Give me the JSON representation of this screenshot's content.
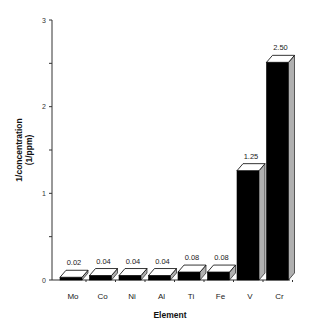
{
  "chart_data": {
    "type": "bar",
    "title": "",
    "xlabel": "Element",
    "ylabel": "1/concentration (1/ppm)",
    "ylabel_lines": [
      "1/concentration",
      "(1/ppm)"
    ],
    "categories": [
      "Mo",
      "Co",
      "Ni",
      "Al",
      "Ti",
      "Fe",
      "V",
      "Cr"
    ],
    "values": [
      0.02,
      0.04,
      0.04,
      0.04,
      0.08,
      0.08,
      1.25,
      2.5
    ],
    "value_labels": [
      "0.02",
      "0.04",
      "0.04",
      "0.04",
      "0.08",
      "0.08",
      "1.25",
      "2.50"
    ],
    "ylim": [
      0,
      3
    ],
    "yticks": [
      0,
      1,
      2,
      3
    ],
    "ytick_labels": [
      "0",
      "1",
      "2",
      "3"
    ],
    "grid": false,
    "style": "3d-bars",
    "colors": {
      "bar_front": "#000000",
      "bar_top": "#ffffff",
      "bar_side": "#b0b0b0",
      "axis": "#333333"
    }
  }
}
